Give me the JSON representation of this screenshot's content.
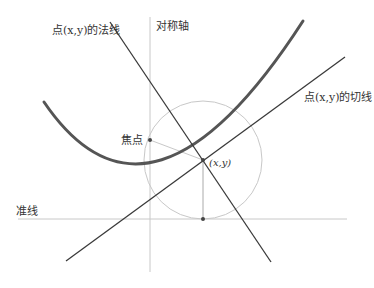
{
  "diagram": {
    "title": "",
    "colors": {
      "background": "#ffffff",
      "parabola": "#555555",
      "lines": "#3a3a3a",
      "guides": "#c8c8c8",
      "circle": "#c8c8c8",
      "text": "#333333"
    },
    "labels": {
      "axis": "对称轴",
      "normal": "点(x,y)的法线",
      "tangent": "点(x,y)的切线",
      "focus": "焦点",
      "point": "(x,y)",
      "directrix": "准线"
    },
    "geometry": {
      "axis_x": 150,
      "directrix_y": 219,
      "focus": [
        150,
        140
      ],
      "vertex": [
        150,
        180
      ],
      "point": [
        203,
        160
      ],
      "foot": [
        203,
        219
      ],
      "circle_radius": 59
    }
  }
}
